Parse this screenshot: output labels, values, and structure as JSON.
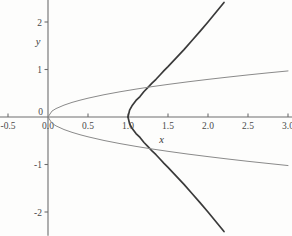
{
  "chart_data": {
    "type": "line",
    "title": "",
    "subtitle": "",
    "xlabel": "x",
    "ylabel": "y",
    "xlim": [
      -0.62,
      3.12
    ],
    "ylim": [
      -2.5,
      2.5
    ],
    "grid": false,
    "legend": "none",
    "x_ticks": [
      {
        "value": -0.5,
        "label": "-0.5"
      },
      {
        "value": 0.0,
        "label": "0.0"
      },
      {
        "value": 0.5,
        "label": "0.5"
      },
      {
        "value": 1.0,
        "label": "1.0"
      },
      {
        "value": 1.5,
        "label": "1.5"
      },
      {
        "value": 2.0,
        "label": "2.0"
      },
      {
        "value": 2.5,
        "label": "2.5"
      },
      {
        "value": 3.0,
        "label": "3.0"
      }
    ],
    "y_ticks": [
      {
        "value": 2,
        "label": "2"
      },
      {
        "value": 1,
        "label": "1"
      },
      {
        "value": 0,
        "label": "0"
      },
      {
        "value": -1,
        "label": "-1"
      },
      {
        "value": -2,
        "label": "-2"
      }
    ],
    "origin_label": "0",
    "series": [
      {
        "name": "cubic-cusp-upper",
        "style": "dark",
        "equation": "y = x*sqrt(x-1)",
        "domain": [
          1.0,
          3.0
        ],
        "points": [
          [
            1.0,
            0.0
          ],
          [
            1.02,
            0.144
          ],
          [
            1.05,
            0.235
          ],
          [
            1.1,
            0.348
          ],
          [
            1.15,
            0.43
          ],
          [
            1.2,
            0.537
          ],
          [
            1.25,
            0.625
          ],
          [
            1.3,
            0.712
          ],
          [
            1.35,
            0.794
          ],
          [
            1.4,
            0.885
          ],
          [
            1.45,
            0.976
          ],
          [
            1.5,
            1.061
          ],
          [
            1.6,
            1.239
          ],
          [
            1.7,
            1.418
          ],
          [
            1.8,
            1.61
          ],
          [
            1.9,
            1.803
          ],
          [
            2.0,
            2.0
          ],
          [
            2.1,
            2.205
          ],
          [
            2.2,
            2.412
          ]
        ]
      },
      {
        "name": "cubic-cusp-lower",
        "style": "dark",
        "equation": "y = -x*sqrt(x-1)",
        "domain": [
          1.0,
          3.0
        ],
        "points": [
          [
            1.0,
            0.0
          ],
          [
            1.02,
            -0.144
          ],
          [
            1.05,
            -0.235
          ],
          [
            1.1,
            -0.348
          ],
          [
            1.15,
            -0.43
          ],
          [
            1.2,
            -0.537
          ],
          [
            1.25,
            -0.625
          ],
          [
            1.3,
            -0.712
          ],
          [
            1.35,
            -0.794
          ],
          [
            1.4,
            -0.885
          ],
          [
            1.45,
            -0.976
          ],
          [
            1.5,
            -1.061
          ],
          [
            1.6,
            -1.239
          ],
          [
            1.7,
            -1.418
          ],
          [
            1.8,
            -1.61
          ],
          [
            1.9,
            -1.803
          ],
          [
            2.0,
            -2.0
          ],
          [
            2.1,
            -2.205
          ],
          [
            2.2,
            -2.412
          ]
        ]
      },
      {
        "name": "sqrt-upper",
        "style": "light",
        "equation": "y = 0.56*sqrt(x)",
        "domain": [
          0.0,
          3.0
        ],
        "points": [
          [
            0.0,
            0.0
          ],
          [
            0.05,
            0.125
          ],
          [
            0.1,
            0.177
          ],
          [
            0.2,
            0.25
          ],
          [
            0.3,
            0.307
          ],
          [
            0.4,
            0.354
          ],
          [
            0.5,
            0.396
          ],
          [
            0.7,
            0.469
          ],
          [
            0.9,
            0.531
          ],
          [
            1.1,
            0.587
          ],
          [
            1.3,
            0.639
          ],
          [
            1.5,
            0.686
          ],
          [
            1.75,
            0.741
          ],
          [
            2.0,
            0.792
          ],
          [
            2.25,
            0.84
          ],
          [
            2.5,
            0.886
          ],
          [
            2.75,
            0.929
          ],
          [
            3.0,
            0.97
          ]
        ]
      },
      {
        "name": "sqrt-lower",
        "style": "light",
        "equation": "y = -0.59*sqrt(x)",
        "domain": [
          0.0,
          3.0
        ],
        "points": [
          [
            0.0,
            0.0
          ],
          [
            0.05,
            -0.132
          ],
          [
            0.1,
            -0.187
          ],
          [
            0.2,
            -0.264
          ],
          [
            0.3,
            -0.323
          ],
          [
            0.4,
            -0.373
          ],
          [
            0.5,
            -0.417
          ],
          [
            0.7,
            -0.494
          ],
          [
            0.9,
            -0.56
          ],
          [
            1.1,
            -0.619
          ],
          [
            1.3,
            -0.673
          ],
          [
            1.5,
            -0.723
          ],
          [
            1.75,
            -0.781
          ],
          [
            2.0,
            -0.834
          ],
          [
            2.25,
            -0.885
          ],
          [
            2.5,
            -0.933
          ],
          [
            2.75,
            -0.978
          ],
          [
            3.0,
            -1.022
          ]
        ]
      }
    ],
    "annotations": [
      {
        "kind": "cusp",
        "x": 1.0,
        "y": 0.0,
        "note": "cusp of dark curve"
      },
      {
        "kind": "intersection",
        "x": 2.0,
        "y": 0.8,
        "note": "upper branches cross"
      },
      {
        "kind": "intersection",
        "x": 2.0,
        "y": -0.85,
        "note": "lower branches cross"
      },
      {
        "kind": "origin",
        "x": 0.0,
        "y": 0.0,
        "note": "light curve origin"
      }
    ]
  },
  "colors": {
    "background": "#fdfdfc",
    "axis": "#6e6e6e",
    "curve_dark": "#3a3a3a",
    "curve_light": "#8a8a8a",
    "tick_label": "#4a4a4a"
  }
}
